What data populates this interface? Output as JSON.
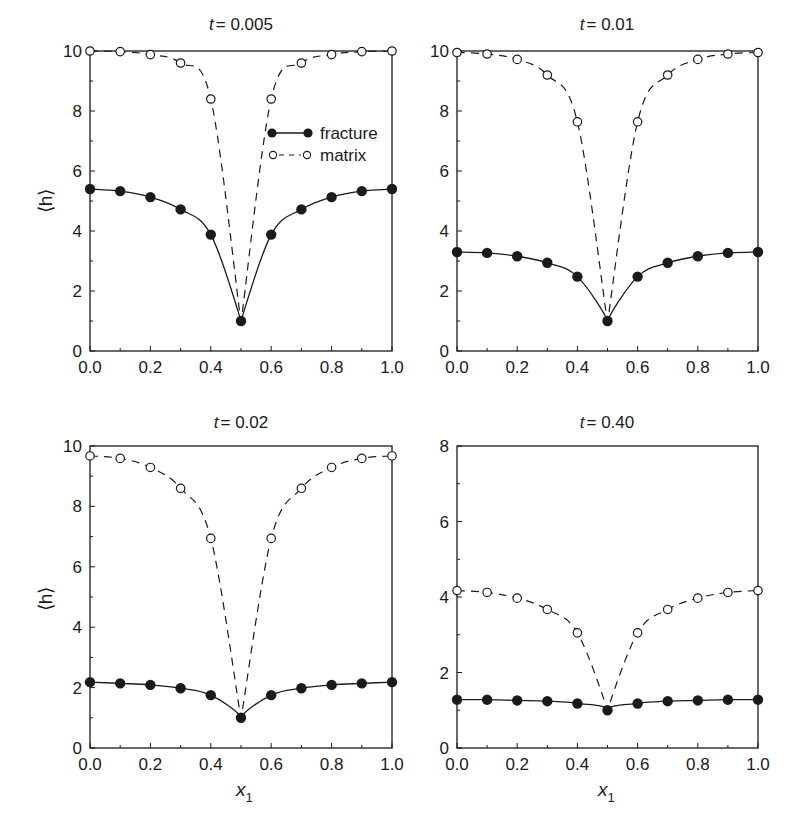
{
  "figure": {
    "legend": {
      "fracture_label": "fracture",
      "matrix_label": "matrix"
    },
    "xlabel": "x",
    "xlabel_sub": "1",
    "ylabel": "⟨h⟩"
  },
  "chart_data": [
    {
      "type": "line",
      "title": "t = 0.005",
      "title_prefix": "t",
      "title_value": "= 0.005",
      "xlabel": "",
      "ylabel": "⟨h⟩",
      "xlim": [
        0.0,
        1.0
      ],
      "ylim": [
        0,
        10
      ],
      "xticks": [
        "0.0",
        "0.2",
        "0.4",
        "0.6",
        "0.8",
        "1.0"
      ],
      "yticks": [
        "0",
        "2",
        "4",
        "6",
        "8",
        "10"
      ],
      "grid": false,
      "legend_position": "upper right (inside)",
      "x": [
        0.0,
        0.1,
        0.2,
        0.3,
        0.4,
        0.5,
        0.6,
        0.7,
        0.8,
        0.9,
        1.0
      ],
      "series": [
        {
          "name": "fracture",
          "style": "solid line, filled circles",
          "values": [
            5.4,
            5.33,
            5.13,
            4.72,
            3.88,
            1.0,
            3.88,
            4.72,
            5.13,
            5.33,
            5.4
          ]
        },
        {
          "name": "matrix",
          "style": "dashed line, open circles",
          "values": [
            10.0,
            9.98,
            9.88,
            9.6,
            8.4,
            1.0,
            8.4,
            9.6,
            9.88,
            9.98,
            10.0
          ]
        }
      ]
    },
    {
      "type": "line",
      "title": "t = 0.01",
      "title_prefix": "t",
      "title_value": "= 0.01",
      "xlabel": "",
      "ylabel": "",
      "xlim": [
        0.0,
        1.0
      ],
      "ylim": [
        0,
        10
      ],
      "xticks": [
        "0.0",
        "0.2",
        "0.4",
        "0.6",
        "0.8",
        "1.0"
      ],
      "yticks": [
        "0",
        "2",
        "4",
        "6",
        "8",
        "10"
      ],
      "grid": false,
      "x": [
        0.0,
        0.1,
        0.2,
        0.3,
        0.4,
        0.5,
        0.6,
        0.7,
        0.8,
        0.9,
        1.0
      ],
      "series": [
        {
          "name": "fracture",
          "style": "solid line, filled circles",
          "values": [
            3.3,
            3.27,
            3.16,
            2.94,
            2.48,
            1.0,
            2.48,
            2.94,
            3.16,
            3.27,
            3.3
          ]
        },
        {
          "name": "matrix",
          "style": "dashed line, open circles",
          "values": [
            9.95,
            9.9,
            9.72,
            9.2,
            7.64,
            1.0,
            7.64,
            9.2,
            9.72,
            9.9,
            9.95
          ]
        }
      ]
    },
    {
      "type": "line",
      "title": "t = 0.02",
      "title_prefix": "t",
      "title_value": "= 0.02",
      "xlabel": "x1",
      "ylabel": "⟨h⟩",
      "xlim": [
        0.0,
        1.0
      ],
      "ylim": [
        0,
        10
      ],
      "xticks": [
        "0.0",
        "0.2",
        "0.4",
        "0.6",
        "0.8",
        "1.0"
      ],
      "yticks": [
        "0",
        "2",
        "4",
        "6",
        "8",
        "10"
      ],
      "grid": false,
      "x": [
        0.0,
        0.1,
        0.2,
        0.3,
        0.4,
        0.5,
        0.6,
        0.7,
        0.8,
        0.9,
        1.0
      ],
      "series": [
        {
          "name": "fracture",
          "style": "solid line, filled circles",
          "values": [
            2.18,
            2.14,
            2.09,
            1.98,
            1.75,
            1.0,
            1.75,
            1.98,
            2.09,
            2.14,
            2.18
          ]
        },
        {
          "name": "matrix",
          "style": "dashed line, open circles",
          "values": [
            9.67,
            9.59,
            9.29,
            8.6,
            6.94,
            1.0,
            6.94,
            8.6,
            9.29,
            9.59,
            9.67
          ]
        }
      ]
    },
    {
      "type": "line",
      "title": "t = 0.40",
      "title_prefix": "t",
      "title_value": "= 0.40",
      "xlabel": "x1",
      "ylabel": "",
      "xlim": [
        0.0,
        1.0
      ],
      "ylim": [
        0,
        8
      ],
      "xticks": [
        "0.0",
        "0.2",
        "0.4",
        "0.6",
        "0.8",
        "1.0"
      ],
      "yticks": [
        "0",
        "2",
        "4",
        "6",
        "8"
      ],
      "grid": false,
      "x": [
        0.0,
        0.1,
        0.2,
        0.3,
        0.4,
        0.5,
        0.6,
        0.7,
        0.8,
        0.9,
        1.0
      ],
      "series": [
        {
          "name": "fracture",
          "style": "solid line, filled circles",
          "values": [
            1.28,
            1.28,
            1.26,
            1.24,
            1.18,
            1.0,
            1.18,
            1.24,
            1.26,
            1.28,
            1.28
          ]
        },
        {
          "name": "matrix",
          "style": "dashed line, open circles",
          "values": [
            4.17,
            4.12,
            3.97,
            3.67,
            3.05,
            1.0,
            3.05,
            3.67,
            3.97,
            4.12,
            4.17
          ]
        }
      ]
    }
  ]
}
